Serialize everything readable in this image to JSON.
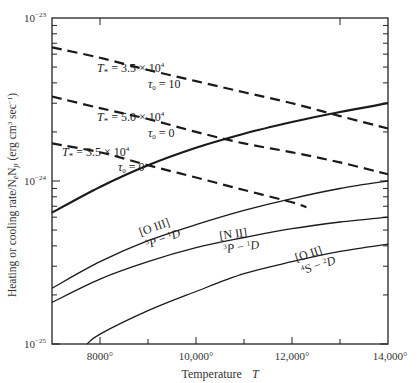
{
  "chart_data": {
    "type": "line",
    "title": "",
    "xlabel": "Temperature T",
    "ylabel": "Heating or cooling rate/N_eN_p (erg cm^3 sec^-1)",
    "xscale": "linear",
    "yscale": "log",
    "xlim": [
      7000,
      14000
    ],
    "ylim": [
      1e-25,
      1e-23
    ],
    "grid": false,
    "legend": "none (inline labels)",
    "x_ticks": [
      {
        "value": 8000,
        "label": "8000°"
      },
      {
        "value": 10000,
        "label": "10,000°"
      },
      {
        "value": 12000,
        "label": "12,000°"
      },
      {
        "value": 14000,
        "label": "14,000°"
      }
    ],
    "x_minor_ticks": [
      9000,
      11000,
      13000
    ],
    "y_ticks": [
      {
        "value": 1e-23,
        "label_base": "10",
        "label_exp": "−23"
      },
      {
        "value": 1e-24,
        "label_base": "10",
        "label_exp": "−24"
      },
      {
        "value": 1e-25,
        "label_base": "10",
        "label_exp": "−25"
      }
    ],
    "series": [
      {
        "name": "Heating T* = 3.5 × 10^4, τ0 = 10",
        "kind": "heating",
        "style": "dashed",
        "x": [
          7000,
          8000,
          9000,
          10000,
          11000,
          12000,
          13000,
          14000
        ],
        "y": [
          6.6e-24,
          5.7e-24,
          4.8e-24,
          4.1e-24,
          3.5e-24,
          3e-24,
          2.5e-24,
          2.1e-24
        ]
      },
      {
        "name": "Heating T* = 5.0 × 10^4, τ0 = 0",
        "kind": "heating",
        "style": "dashed",
        "x": [
          7000,
          8000,
          9000,
          10000,
          11000,
          12000,
          13000,
          14000
        ],
        "y": [
          3.3e-24,
          2.8e-24,
          2.4e-24,
          2e-24,
          1.7e-24,
          1.5e-24,
          1.3e-24,
          1.1e-24
        ]
      },
      {
        "name": "Heating T* = 3.5 × 10^4, τ0 = 0",
        "kind": "heating",
        "style": "dashed",
        "x": [
          7000,
          8000,
          9000,
          10000,
          11000,
          12000,
          12300
        ],
        "y": [
          1.7e-24,
          1.5e-24,
          1.25e-24,
          1.05e-24,
          8.8e-25,
          7.4e-25,
          6.9e-25
        ]
      },
      {
        "name": "Total cooling",
        "kind": "cooling",
        "style": "solid-thick",
        "x": [
          7000,
          8000,
          9000,
          10000,
          11000,
          12000,
          13000,
          14000
        ],
        "y": [
          6.4e-25,
          9.2e-25,
          1.25e-24,
          1.6e-24,
          1.95e-24,
          2.3e-24,
          2.65e-24,
          3e-24
        ]
      },
      {
        "name": "[O III] 3P − 1D",
        "kind": "cooling",
        "style": "solid-thin",
        "x": [
          7000,
          8000,
          9000,
          10000,
          11000,
          12000,
          13000,
          14000
        ],
        "y": [
          2.2e-25,
          3.2e-25,
          4.3e-25,
          5.4e-25,
          6.6e-25,
          7.8e-25,
          9e-25,
          1e-24
        ]
      },
      {
        "name": "[N II] 3P − 1D",
        "kind": "cooling",
        "style": "solid-thin",
        "x": [
          7000,
          8000,
          9000,
          10000,
          11000,
          12000,
          13000,
          14000
        ],
        "y": [
          1.8e-25,
          2.5e-25,
          3.2e-25,
          3.9e-25,
          4.5e-25,
          5.1e-25,
          5.6e-25,
          6e-25
        ]
      },
      {
        "name": "[O II] 4S − 2D",
        "kind": "cooling",
        "style": "solid-thin",
        "x": [
          7730,
          8000,
          9000,
          10000,
          11000,
          12000,
          13000,
          14000
        ],
        "y": [
          1e-25,
          1.15e-25,
          1.6e-25,
          2.1e-25,
          2.7e-25,
          3.2e-25,
          3.7e-25,
          4.1e-25
        ]
      }
    ],
    "annotations": [
      {
        "id": "a1",
        "line1": "T* = 3.5 × 10^4",
        "line2": "τ0 = 10"
      },
      {
        "id": "a2",
        "line1": "T* = 5.0 × 10^4",
        "line2": "τ0 = 0"
      },
      {
        "id": "a3",
        "line1": "T* = 3.5 × 10^4",
        "line2": "τ0 = 0"
      },
      {
        "id": "oiii",
        "line1": "[O III]",
        "line2": "3P − 1D"
      },
      {
        "id": "nii",
        "line1": "[N II]",
        "line2": "3P − 1D"
      },
      {
        "id": "oii",
        "line1": "[O II]",
        "line2": "4S − 2D"
      }
    ]
  },
  "labels": {
    "xlabel_text": "Temperature",
    "xlabel_var": "T",
    "ylabel_text": "Heating or cooling rate/N",
    "ylabel_sub_e": "e",
    "ylabel_mid": "N",
    "ylabel_sub_p": "p",
    "ylabel_units": " (erg cm",
    "ylabel_units_exp1": "3",
    "ylabel_units_mid": " sec",
    "ylabel_units_exp2": "−1",
    "ylabel_close": ")",
    "tick_x_8000": "8000°",
    "tick_x_10000": "10,000°",
    "tick_x_12000": "12,000°",
    "tick_x_14000": "14,000°",
    "tick_y_base": "10",
    "tick_y_m23": "−23",
    "tick_y_m24": "−24",
    "tick_y_m25": "−25",
    "a1_T": "T",
    "a1_sub": "*",
    "a1_val": " = 3.5 × 10",
    "a1_exp": "4",
    "a1_tau": "τ",
    "a1_tau_sub": "0",
    "a1_tau_val": " = 10",
    "a2_T": "T",
    "a2_sub": "*",
    "a2_val": " = 5.0 × 10",
    "a2_exp": "4",
    "a2_tau": "τ",
    "a2_tau_sub": "0",
    "a2_tau_val": " = 0",
    "a3_T": "T",
    "a3_sub": "*",
    "a3_val": " = 3.5 × 10",
    "a3_exp": "4",
    "a3_tau": "τ",
    "a3_tau_sub": "0",
    "a3_tau_val": " = 0",
    "oiii_name": "[O III]",
    "oiii_l1": "3",
    "oiii_P": "P",
    "oiii_dash": " − ",
    "oiii_l2": "1",
    "oiii_D": "D",
    "nii_name": "[N II]",
    "nii_l1": "3",
    "nii_P": "P",
    "nii_dash": " − ",
    "nii_l2": "1",
    "nii_D": "D",
    "oii_name": "[O II]",
    "oii_l1": "4",
    "oii_S": "S",
    "oii_dash": " − ",
    "oii_l2": "2",
    "oii_D": "D"
  },
  "colors": {
    "background": "#ffffff",
    "axis": "#222222",
    "curve": "#1a1a1a",
    "text": "#333333"
  }
}
